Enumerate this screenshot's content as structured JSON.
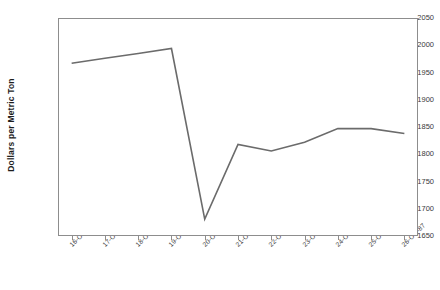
{
  "chart_data": {
    "type": "line",
    "title": "",
    "xlabel": "",
    "ylabel": "Dollars per Metric Ton",
    "categories": [
      "16-Oct-87",
      "17-Oct-87",
      "18-Oct-87",
      "19-Oct-87",
      "20-Oct-87",
      "21-Oct-87",
      "22-Oct-87",
      "23-Oct-87",
      "24-Oct-87",
      "25-Oct-87",
      "26-Oct-87"
    ],
    "values": [
      1967,
      1976,
      1985,
      1994,
      1681,
      1818,
      1806,
      1822,
      1847,
      1847,
      1838
    ],
    "ylim": [
      1650,
      2050
    ],
    "ytick_values": [
      1650,
      1700,
      1750,
      1800,
      1850,
      1900,
      1950,
      2000,
      2050
    ],
    "ytick_labels": [
      "1650",
      "1700",
      "1750",
      "1800",
      "1850",
      "1900",
      "1950",
      "2000",
      "2050"
    ],
    "grid": false,
    "legend": false,
    "series_color": "#6b6b6b",
    "axis_color": "#8d8d8d",
    "text_color": "#3a3a3a",
    "background": "#ffffff"
  }
}
